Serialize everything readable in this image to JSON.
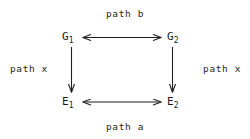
{
  "figure": {
    "type": "commutative-square-diagram",
    "background_color": "#ffffff",
    "ink_color": "#1a1a1a"
  },
  "nodes": [
    {
      "id": "G1",
      "base": "G",
      "subscript": "1",
      "position": "top-left"
    },
    {
      "id": "G2",
      "base": "G",
      "subscript": "2",
      "position": "top-right"
    },
    {
      "id": "E1",
      "base": "E",
      "subscript": "1",
      "position": "bottom-left"
    },
    {
      "id": "E2",
      "base": "E",
      "subscript": "2",
      "position": "bottom-right"
    }
  ],
  "edges": [
    {
      "id": "top",
      "label": "path b",
      "from": "G1",
      "to": "G2",
      "orientation": "horizontal",
      "arrowheads": "both"
    },
    {
      "id": "bottom",
      "label": "path a",
      "from": "E1",
      "to": "E2",
      "orientation": "horizontal",
      "arrowheads": "both"
    },
    {
      "id": "left",
      "label": "path x",
      "from": "G1",
      "to": "E1",
      "orientation": "vertical",
      "arrowheads": "end"
    },
    {
      "id": "right",
      "label": "path x",
      "from": "G2",
      "to": "E2",
      "orientation": "vertical",
      "arrowheads": "end"
    }
  ]
}
